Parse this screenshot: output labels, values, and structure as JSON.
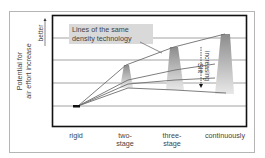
{
  "diagram": {
    "y_axis": {
      "label_line1": "Potential for",
      "label_line2": "air effort increase",
      "direction_label": "better"
    },
    "x_axis": {
      "categories": [
        {
          "line1": "rigid",
          "line2": ""
        },
        {
          "line1": "two-",
          "line2": "stage"
        },
        {
          "line1": "three-",
          "line2": "stage"
        },
        {
          "line1": "continuously",
          "line2": ""
        }
      ]
    },
    "legend_box": {
      "line1": "Lines of the same",
      "line2": "density technology"
    },
    "annotation": {
      "line1": "Slit",
      "line2": "increasing"
    },
    "colors": {
      "frame": "#111111",
      "gridline": "#8a8a8a",
      "legend_bg": "#d9d9d9",
      "trapezoid_top": "#8c8c8c",
      "trapezoid_bottom": "#e6e6e6",
      "marker": "#111111"
    }
  }
}
